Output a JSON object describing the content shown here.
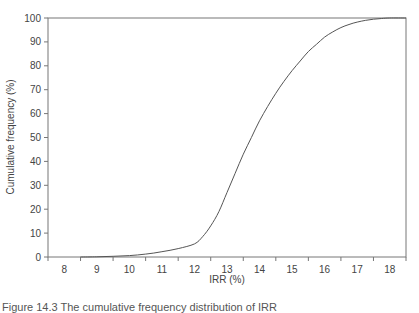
{
  "chart_data": {
    "type": "line",
    "title": "",
    "xlabel": "IRR (%)",
    "ylabel": "Cumulative frequency (%)",
    "xlim": [
      7.5,
      18.5
    ],
    "ylim": [
      0,
      100
    ],
    "x_ticks": [
      8,
      9,
      10,
      11,
      12,
      13,
      14,
      15,
      16,
      17,
      18
    ],
    "y_ticks": [
      0,
      10,
      20,
      30,
      40,
      50,
      60,
      70,
      80,
      90,
      100
    ],
    "grid": false,
    "legend": null,
    "series": [
      {
        "name": "Cumulative frequency",
        "color": "#555555",
        "x": [
          8.5,
          9,
          9.5,
          10,
          10.5,
          11,
          11.5,
          12,
          12.25,
          12.5,
          12.75,
          13,
          13.25,
          13.5,
          13.75,
          14,
          14.25,
          14.5,
          14.75,
          15,
          15.25,
          15.5,
          15.75,
          16,
          16.25,
          16.5,
          16.75,
          17,
          17.25,
          17.5,
          17.75,
          18,
          18.5
        ],
        "y": [
          0,
          0.1,
          0.3,
          0.6,
          1.2,
          2.2,
          3.5,
          5.5,
          8.5,
          13,
          19,
          27,
          35,
          43,
          50,
          57,
          63,
          68.5,
          73.5,
          78,
          82,
          86,
          89,
          92,
          94.2,
          96,
          97.3,
          98.3,
          99,
          99.5,
          99.8,
          100,
          100
        ]
      }
    ]
  },
  "caption": "Figure 14.3  The cumulative frequency distribution of IRR"
}
